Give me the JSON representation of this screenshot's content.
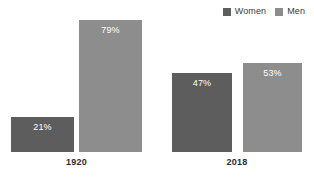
{
  "chart_data": {
    "type": "bar",
    "title": "",
    "subtitle": "",
    "xlabel": "",
    "ylabel": "",
    "ylim": [
      0,
      100
    ],
    "grid": false,
    "legend_position": "top-right",
    "categories": [
      "1920",
      "2018"
    ],
    "series": [
      {
        "name": "Women",
        "color": "#5d5d5d",
        "values": [
          21,
          79
        ]
      },
      {
        "name": "Men",
        "color": "#8d8d8d",
        "values": [
          47,
          53
        ]
      }
    ],
    "bars": [
      {
        "category": "1920",
        "series": "Women",
        "value": 21,
        "label": "21%",
        "color": "#5d5d5d"
      },
      {
        "category": "1920",
        "series": "Men",
        "value": 79,
        "label": "79%",
        "color": "#8d8d8d"
      },
      {
        "category": "2018",
        "series": "Women",
        "value": 47,
        "label": "47%",
        "color": "#5d5d5d"
      },
      {
        "category": "2018",
        "series": "Men",
        "value": 53,
        "label": "53%",
        "color": "#8d8d8d"
      }
    ],
    "annotations": []
  },
  "legend": {
    "items": [
      {
        "label": "Women",
        "color": "#5d5d5d"
      },
      {
        "label": "Men",
        "color": "#8d8d8d"
      }
    ]
  },
  "axis": {
    "category_labels": [
      "1920",
      "2018"
    ]
  }
}
